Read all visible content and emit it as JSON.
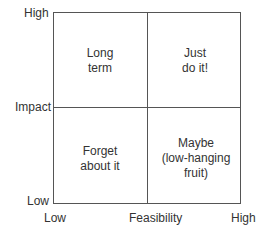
{
  "diagram": {
    "type": "2x2 priority matrix",
    "y_axis": {
      "label": "Impact",
      "high": "High",
      "low": "Low"
    },
    "x_axis": {
      "label": "Feasibility",
      "low": "Low",
      "high": "High"
    },
    "quadrants": {
      "top_left": {
        "line1": "Long",
        "line2": "term"
      },
      "top_right": {
        "line1": "Just",
        "line2": "do it!"
      },
      "bottom_left": {
        "line1": "Forget",
        "line2": "about it"
      },
      "bottom_right": {
        "line1": "Maybe",
        "line2": "(low-hanging",
        "line3": "fruit)"
      }
    },
    "line_color": "#555555"
  }
}
